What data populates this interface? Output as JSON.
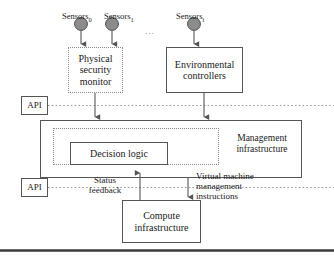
{
  "diagram": {
    "colors": {
      "stroke": "#555555",
      "dotted_stroke": "#8a8a8a",
      "sensor_fill": "#8c8c8c",
      "sensor_stroke": "#4d4d4d",
      "api_line": "#9a9a9a",
      "footer_rule": "#3c3c3c",
      "background": "#ffffff"
    },
    "sensors": [
      {
        "name": "sensor-0",
        "label": "Sensors",
        "subscript": "0"
      },
      {
        "name": "sensor-1",
        "label": "Sensors",
        "subscript": "1"
      },
      {
        "name": "sensor-i",
        "label": "Sensors",
        "subscript": "i"
      }
    ],
    "ellipsis": "...",
    "nodes": {
      "physical_security_monitor": {
        "label": "Physical\nsecurity\nmonitor",
        "border": "dotted"
      },
      "environmental_controllers": {
        "label": "Environmental\ncontrollers",
        "border": "solid"
      },
      "management_infrastructure": {
        "label": "Management\ninfrastructure",
        "border": "solid"
      },
      "decision_logic": {
        "label": "Decision logic",
        "border": "solid"
      },
      "compute_infrastructure": {
        "label": "Compute\ninfrastructure",
        "border": "solid"
      },
      "api_upper": {
        "label": "API",
        "border": "solid"
      },
      "api_lower": {
        "label": "API",
        "border": "solid"
      }
    },
    "edge_labels": {
      "status_feedback": "Status\nfeedback",
      "vm_management_instructions": "Virtual machine\nmanagement\ninstructions"
    }
  }
}
